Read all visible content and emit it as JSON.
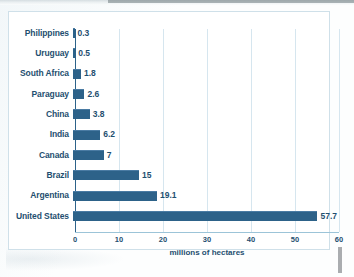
{
  "chart_data": {
    "type": "bar",
    "orientation": "horizontal",
    "title": "",
    "xlabel": "millions of hectares",
    "ylabel": "",
    "xlim": [
      0,
      60
    ],
    "xticks": [
      0,
      10,
      20,
      30,
      40,
      50,
      60
    ],
    "xtick_labels": [
      "0",
      "10",
      "20",
      "30",
      "40",
      "50",
      "60"
    ],
    "grid": "vertical",
    "legend": "none",
    "bar_color": "#2d6289",
    "label_color": "#1f4f70",
    "gridline_color": "#d6e6ef",
    "categories": [
      "Philippines",
      "Uruguay",
      "South Africa",
      "Paraguay",
      "China",
      "India",
      "Canada",
      "Brazil",
      "Argentina",
      "United States"
    ],
    "values": [
      0.3,
      0.5,
      1.8,
      2.6,
      3.8,
      6.2,
      7,
      15,
      19.1,
      57.7
    ],
    "value_labels": [
      "0.3",
      "0.5",
      "1.8",
      "2.6",
      "3.8",
      "6.2",
      "7",
      "15",
      "19.1",
      "57.7"
    ]
  }
}
